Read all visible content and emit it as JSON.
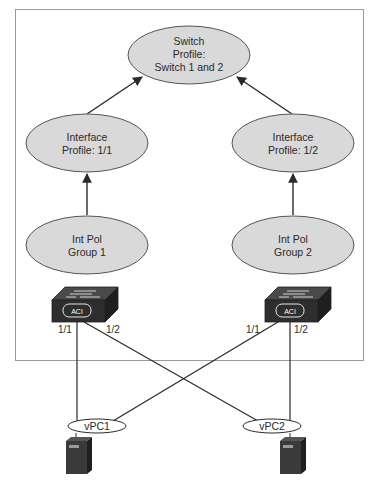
{
  "colors": {
    "background": "#ffffff",
    "frame": "#9a9a9a",
    "node_fill": "#d9d9d9",
    "node_stroke": "#555555",
    "line": "#2a2a2a",
    "device_dark": "#2e2e2e",
    "device_top": "#4a4a4a"
  },
  "nodes": {
    "switch_profile": {
      "line1": "Switch",
      "line2": "Profile:",
      "line3": "Switch 1 and 2"
    },
    "interface_profile_1": {
      "line1": "Interface",
      "line2": "Profile: 1/1"
    },
    "interface_profile_2": {
      "line1": "Interface",
      "line2": "Profile: 1/2"
    },
    "int_pol_group_1": {
      "line1": "Int Pol",
      "line2": "Group 1"
    },
    "int_pol_group_2": {
      "line1": "Int Pol",
      "line2": "Group 2"
    }
  },
  "switches": [
    {
      "badge": "ACI",
      "port_left": "1/1",
      "port_right": "1/2"
    },
    {
      "badge": "ACI",
      "port_left": "1/1",
      "port_right": "1/2"
    }
  ],
  "vpcs": [
    {
      "label": "vPC1"
    },
    {
      "label": "vPC2"
    }
  ]
}
